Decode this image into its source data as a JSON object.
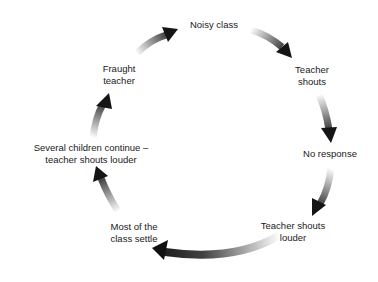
{
  "diagram": {
    "type": "cycle",
    "background": "#ffffff",
    "arrow_dark": "#111111",
    "arrow_light": "#ffffff",
    "nodes": [
      {
        "id": "noisy-class",
        "lines": [
          "Noisy class"
        ]
      },
      {
        "id": "teacher-shouts",
        "lines": [
          "Teacher",
          "shouts"
        ]
      },
      {
        "id": "no-response",
        "lines": [
          "No response"
        ]
      },
      {
        "id": "teacher-shouts-louder",
        "lines": [
          "Teacher shouts",
          "louder"
        ]
      },
      {
        "id": "most-settle",
        "lines": [
          "Most of the",
          "class settle"
        ]
      },
      {
        "id": "several-continue",
        "lines": [
          "Several children continue –",
          "teacher shouts louder"
        ]
      },
      {
        "id": "fraught-teacher",
        "lines": [
          "Fraught",
          "teacher"
        ]
      }
    ],
    "edges": [
      {
        "from": "fraught-teacher",
        "to": "noisy-class"
      },
      {
        "from": "noisy-class",
        "to": "teacher-shouts"
      },
      {
        "from": "teacher-shouts",
        "to": "no-response"
      },
      {
        "from": "no-response",
        "to": "teacher-shouts-louder"
      },
      {
        "from": "teacher-shouts-louder",
        "to": "most-settle"
      },
      {
        "from": "most-settle",
        "to": "several-continue"
      },
      {
        "from": "several-continue",
        "to": "fraught-teacher"
      }
    ]
  }
}
